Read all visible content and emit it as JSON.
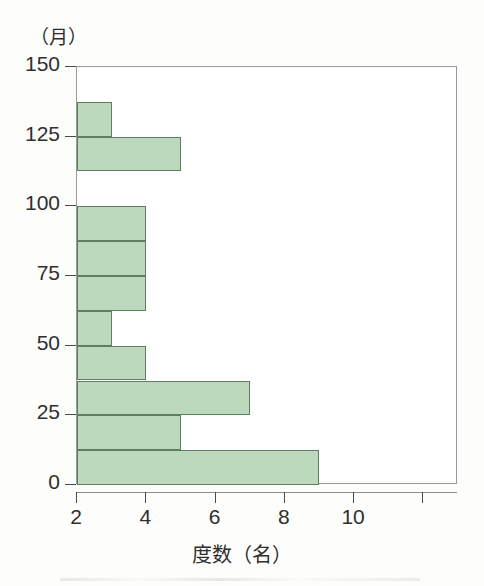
{
  "figure": {
    "background_color": "#fdfdfb",
    "plot_background_color": "#ffffff"
  },
  "axes": {
    "y_unit_label": "（月）",
    "x_axis_title": "度数（名）",
    "y_tick_labels": [
      "150",
      "125",
      "100",
      "75",
      "50",
      "25",
      "0"
    ],
    "x_tick_labels": [
      "2",
      "4",
      "6",
      "8",
      "10",
      ""
    ]
  },
  "style": {
    "bar_fill": "#bcd9bd",
    "bar_border": "#5d7e61",
    "axis_color": "#4a4a4a",
    "box_color": "#9a9a9a",
    "text_color": "#2f2f2f"
  },
  "chart_data": {
    "type": "bar",
    "orientation": "horizontal",
    "title": "",
    "subtitle": "",
    "xlabel": "度数（名）",
    "ylabel": "（月）",
    "xlim": [
      2,
      13.0
    ],
    "ylim": [
      0,
      150
    ],
    "xticks": [
      2,
      4,
      6,
      8,
      10,
      12
    ],
    "yticks": [
      0,
      25,
      50,
      75,
      100,
      125,
      150
    ],
    "grid": false,
    "legend": null,
    "bin_width": 12.5,
    "note": "Horizontal histogram; x axis is truncated and begins at 2, so bars are drawn from 2. Bins with frequency 0 (or at/below 2) show no bar.",
    "categories": [
      "0–12.5",
      "12.5–25",
      "25–37.5",
      "37.5–50",
      "50–62.5",
      "62.5–75",
      "75–87.5",
      "87.5–100",
      "100–112.5",
      "112.5–125",
      "125–137.5",
      "137.5–150"
    ],
    "values": [
      9,
      5,
      7,
      4,
      3,
      4,
      4,
      4,
      0,
      5,
      3,
      0
    ],
    "bins": [
      {
        "y_low": 0,
        "y_high": 12.5,
        "value": 9
      },
      {
        "y_low": 12.5,
        "y_high": 25,
        "value": 5
      },
      {
        "y_low": 25,
        "y_high": 37.5,
        "value": 7
      },
      {
        "y_low": 37.5,
        "y_high": 50,
        "value": 4
      },
      {
        "y_low": 50,
        "y_high": 62.5,
        "value": 3
      },
      {
        "y_low": 62.5,
        "y_high": 75,
        "value": 4
      },
      {
        "y_low": 75,
        "y_high": 87.5,
        "value": 4
      },
      {
        "y_low": 87.5,
        "y_high": 100,
        "value": 4
      },
      {
        "y_low": 100,
        "y_high": 112.5,
        "value": 0
      },
      {
        "y_low": 112.5,
        "y_high": 125,
        "value": 5
      },
      {
        "y_low": 125,
        "y_high": 137.5,
        "value": 3
      },
      {
        "y_low": 137.5,
        "y_high": 150,
        "value": 0
      }
    ]
  }
}
